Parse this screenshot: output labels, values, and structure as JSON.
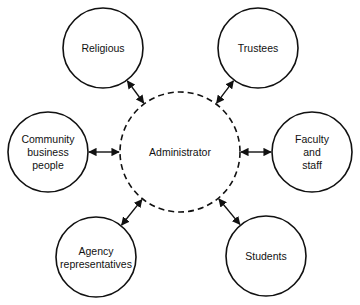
{
  "diagram": {
    "center": {
      "label": "Administrator",
      "cx": 180,
      "cy": 152,
      "r": 60
    },
    "nodes": [
      {
        "id": "religious",
        "lines": [
          "Religious"
        ],
        "cx": 103,
        "cy": 48,
        "r": 40
      },
      {
        "id": "trustees",
        "lines": [
          "Trustees"
        ],
        "cx": 258,
        "cy": 48,
        "r": 40
      },
      {
        "id": "community-business-people",
        "lines": [
          "Community",
          "business",
          "people"
        ],
        "cx": 48,
        "cy": 152,
        "r": 40
      },
      {
        "id": "faculty-and-staff",
        "lines": [
          "Faculty",
          "and",
          "staff"
        ],
        "cx": 312,
        "cy": 152,
        "r": 40
      },
      {
        "id": "agency-representatives",
        "lines": [
          "Agency",
          "representatives"
        ],
        "cx": 96,
        "cy": 257,
        "r": 40
      },
      {
        "id": "students",
        "lines": [
          "Students"
        ],
        "cx": 266,
        "cy": 256,
        "r": 40
      }
    ],
    "connections": "bidirectional",
    "colors": {
      "stroke": "#111111",
      "background": "#ffffff"
    }
  }
}
